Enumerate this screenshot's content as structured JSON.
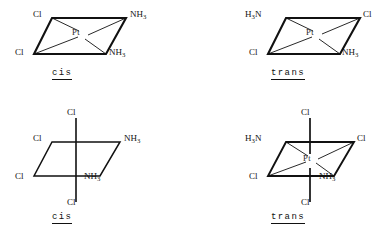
{
  "figure": {
    "background_color": "#ffffff",
    "line_color": "#111111",
    "text_color": "#111111"
  },
  "structures": [
    {
      "id": "square-planar-cis",
      "geometry": "square-planar",
      "center_atom": "Pt",
      "caption": "cis",
      "ligands": {
        "top_left": "Cl",
        "top_right_N": "NH",
        "top_right_sub": "3",
        "bottom_left": "Cl",
        "bottom_right_N": "NH",
        "bottom_right_sub": "3"
      }
    },
    {
      "id": "square-planar-trans",
      "geometry": "square-planar",
      "center_atom": "Pt",
      "caption": "trans",
      "ligands": {
        "top_left_H": "H",
        "top_left_sub": "3",
        "top_left_N": "N",
        "top_right": "Cl",
        "bottom_left": "Cl",
        "bottom_right_N": "NH",
        "bottom_right_sub": "3"
      }
    },
    {
      "id": "octahedral-cis",
      "geometry": "octahedral",
      "center_atom": "",
      "caption": "cis",
      "ligands": {
        "axial_top": "Cl",
        "axial_bottom": "Cl",
        "top_left": "Cl",
        "top_right_N": "NH",
        "top_right_sub": "3",
        "bottom_left": "Cl",
        "bottom_right_N": "NH",
        "bottom_right_sub": "3"
      }
    },
    {
      "id": "octahedral-trans",
      "geometry": "octahedral",
      "center_atom": "Pt",
      "caption": "trans",
      "ligands": {
        "axial_top": "Cl",
        "axial_bottom": "Cl",
        "top_left_H": "H",
        "top_left_sub": "3",
        "top_left_N": "N",
        "top_right": "Cl",
        "bottom_left": "Cl",
        "bottom_right_N": "NH",
        "bottom_right_sub": "3"
      }
    }
  ],
  "captions": {
    "top_left": "cis",
    "top_right": "trans",
    "bottom_left": "cis",
    "bottom_right": "trans"
  },
  "atoms": {
    "platinum": "Pt",
    "chloride": "Cl",
    "ammine_N": "NH",
    "ammine_N_reversed": "N",
    "hydrogen": "H",
    "subscript_three": "3"
  }
}
